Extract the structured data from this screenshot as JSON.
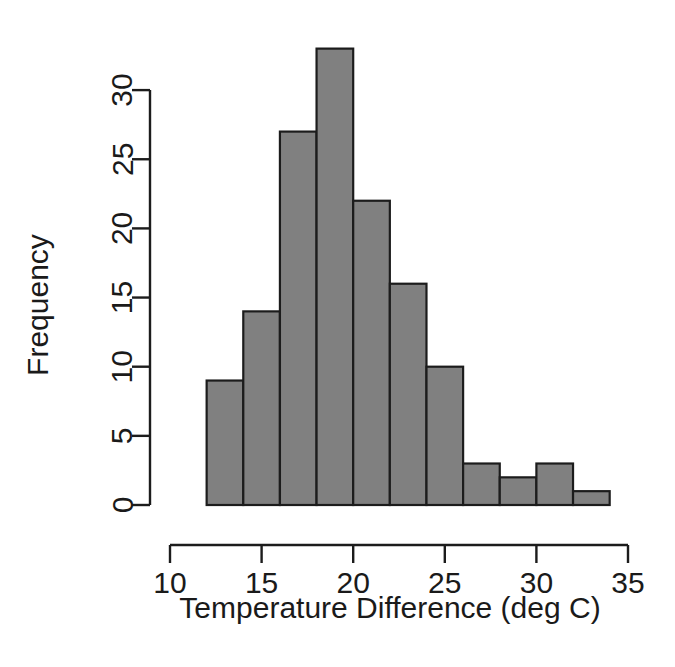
{
  "chart_data": {
    "type": "bar",
    "chart_subtype": "histogram",
    "title": "",
    "xlabel": "Temperature Difference (deg C)",
    "ylabel": "Frequency",
    "xlim": [
      10,
      35
    ],
    "ylim": [
      0,
      33
    ],
    "grid": false,
    "legend": null,
    "bin_width": 2,
    "bin_edges": [
      12,
      14,
      16,
      18,
      20,
      22,
      24,
      26,
      28,
      30,
      32,
      34
    ],
    "categories": [
      "12-14",
      "14-16",
      "16-18",
      "18-20",
      "20-22",
      "22-24",
      "24-26",
      "26-28",
      "28-30",
      "30-32",
      "32-34"
    ],
    "bin_centers": [
      13,
      15,
      17,
      19,
      21,
      23,
      25,
      27,
      29,
      31,
      33
    ],
    "values": [
      9,
      14,
      27,
      33,
      22,
      16,
      10,
      3,
      2,
      3,
      1
    ],
    "total_count": 140,
    "x_ticks": [
      10,
      15,
      20,
      25,
      30,
      35
    ],
    "x_tick_labels": [
      "10",
      "15",
      "20",
      "25",
      "30",
      "35"
    ],
    "y_ticks": [
      0,
      5,
      10,
      15,
      20,
      25,
      30
    ],
    "y_tick_labels": [
      "0",
      "5",
      "10",
      "15",
      "20",
      "25",
      "30"
    ],
    "bar_fill_color": "#808080",
    "bar_border_color": "#1c1c1c",
    "axis_color": "#1c1c1c",
    "background_color": "#ffffff"
  }
}
